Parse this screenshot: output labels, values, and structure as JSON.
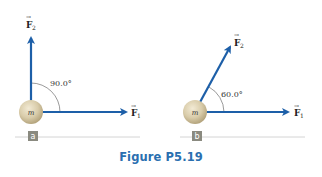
{
  "figure": {
    "caption": "Figure P5.19",
    "colors": {
      "arrow": "#1d5fa8",
      "ball": "#d9ccaa",
      "ball_shadow": "#b5a57e",
      "label_box": "#8a8a80",
      "caption": "#2a6fb0",
      "baseline": "#cfcfcf"
    },
    "panels": [
      {
        "id": "a",
        "label": "a",
        "mass_label": "m",
        "angle_label": "90.0°",
        "angle_deg": 90.0,
        "forces": [
          {
            "name": "F1",
            "symbol": "F",
            "subscript": "1",
            "direction_deg": 0
          },
          {
            "name": "F2",
            "symbol": "F",
            "subscript": "2",
            "direction_deg": 90
          }
        ]
      },
      {
        "id": "b",
        "label": "b",
        "mass_label": "m",
        "angle_label": "60.0°",
        "angle_deg": 60.0,
        "forces": [
          {
            "name": "F1",
            "symbol": "F",
            "subscript": "1",
            "direction_deg": 0
          },
          {
            "name": "F2",
            "symbol": "F",
            "subscript": "2",
            "direction_deg": 60
          }
        ]
      }
    ]
  }
}
